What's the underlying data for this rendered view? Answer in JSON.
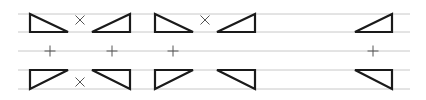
{
  "diagram": {
    "colors": {
      "background": "#ffffff",
      "guide_line": "#c8c8c8",
      "shape_stroke": "#1a1a1a",
      "mark_stroke": "#555555"
    },
    "guide_lines": {
      "x_start": 18,
      "x_end": 410,
      "y": [
        14,
        32,
        51,
        70,
        89
      ]
    },
    "triangles": [
      {
        "id": "t1-top",
        "points": "30,14 30,32 68,32"
      },
      {
        "id": "t2-top",
        "points": "130,14 130,32 92,32"
      },
      {
        "id": "t3-top",
        "points": "155,14 155,32 193,32"
      },
      {
        "id": "t4-top",
        "points": "255,14 255,32 217,32"
      },
      {
        "id": "t5-top",
        "points": "392,14 392,32 355,32"
      },
      {
        "id": "t1-bottom",
        "points": "30,70 30,89 68,70"
      },
      {
        "id": "t2-bottom",
        "points": "130,70 130,89 92,70"
      },
      {
        "id": "t3-bottom",
        "points": "155,70 155,89 193,70"
      },
      {
        "id": "t4-bottom",
        "points": "255,70 255,89 217,70"
      },
      {
        "id": "t5-bottom",
        "points": "392,70 392,89 355,70"
      }
    ],
    "cross_marks": [
      {
        "x": 80,
        "y": 20
      },
      {
        "x": 205,
        "y": 20
      },
      {
        "x": 80,
        "y": 82
      }
    ],
    "plus_marks": [
      {
        "x": 50,
        "y": 51
      },
      {
        "x": 112,
        "y": 51
      },
      {
        "x": 173,
        "y": 51
      },
      {
        "x": 373,
        "y": 51
      }
    ]
  }
}
